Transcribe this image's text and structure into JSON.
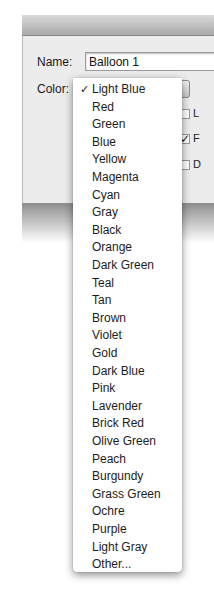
{
  "dialog": {
    "name_label": "Name:",
    "name_value": "Balloon 1",
    "color_label": "Color:",
    "checkboxes": [
      {
        "label": "L",
        "checked": false
      },
      {
        "label": "F",
        "checked": true
      },
      {
        "label": "D",
        "checked": false
      }
    ]
  },
  "menu": {
    "selected": "Light Blue",
    "check_glyph": "✓",
    "items": [
      "Light Blue",
      "Red",
      "Green",
      "Blue",
      "Yellow",
      "Magenta",
      "Cyan",
      "Gray",
      "Black",
      "Orange",
      "Dark Green",
      "Teal",
      "Tan",
      "Brown",
      "Violet",
      "Gold",
      "Dark Blue",
      "Pink",
      "Lavender",
      "Brick Red",
      "Olive Green",
      "Peach",
      "Burgundy",
      "Grass Green",
      "Ochre",
      "Purple",
      "Light Gray",
      "Other..."
    ]
  },
  "icons": {
    "popup_arrows": "▲▼",
    "checkmark": "✓"
  }
}
